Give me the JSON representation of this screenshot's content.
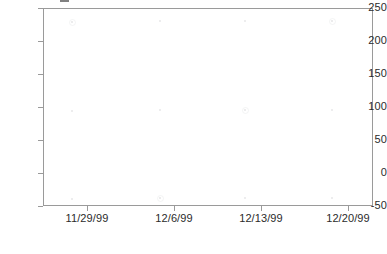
{
  "chart_data": {
    "type": "scatter",
    "title": "",
    "subtitle": "",
    "xlabel": "",
    "ylabel": "",
    "grid": false,
    "legend": "none",
    "ylim": [
      -50,
      250
    ],
    "y_ticks": [
      {
        "value": 250,
        "label": "250"
      },
      {
        "value": 200,
        "label": "200"
      },
      {
        "value": 150,
        "label": "150"
      },
      {
        "value": 100,
        "label": "100"
      },
      {
        "value": 50,
        "label": "50"
      },
      {
        "value": 0,
        "label": "0"
      },
      {
        "value": -50,
        "label": "-50"
      }
    ],
    "x_ticks": [
      {
        "label": "11/29/99",
        "px": 87
      },
      {
        "label": "12/6/99",
        "px": 174
      },
      {
        "label": "12/13/99",
        "px": 261
      },
      {
        "label": "12/20/99",
        "px": 348
      }
    ],
    "x_categories": [
      "11/29/99",
      "12/6/99",
      "12/13/99",
      "12/20/99"
    ],
    "series": [
      {
        "name": "series-1",
        "x": [
          "11/29/99",
          "12/6/99",
          "12/13/99",
          "12/20/99"
        ],
        "values": [
          230,
          230,
          230,
          230
        ]
      },
      {
        "name": "series-2",
        "x": [
          "11/29/99",
          "12/6/99",
          "12/13/99",
          "12/20/99"
        ],
        "values": [
          90,
          90,
          90,
          90
        ]
      },
      {
        "name": "series-3",
        "x": [
          "11/29/99",
          "12/6/99",
          "12/13/99",
          "12/20/99"
        ],
        "values": [
          -38,
          -38,
          -38,
          -38
        ]
      }
    ],
    "marker_points": [
      {
        "px": 72,
        "py": 22
      },
      {
        "px": 160,
        "py": 21
      },
      {
        "px": 245,
        "py": 21
      },
      {
        "px": 332,
        "py": 21
      },
      {
        "px": 72,
        "py": 111
      },
      {
        "px": 160,
        "py": 110
      },
      {
        "px": 245,
        "py": 110
      },
      {
        "px": 332,
        "py": 110
      },
      {
        "px": 72,
        "py": 199
      },
      {
        "px": 160,
        "py": 198
      },
      {
        "px": 245,
        "py": 198
      },
      {
        "px": 332,
        "py": 198
      }
    ],
    "colors": {
      "background": "#ffffff",
      "frame": "#9a9a9a",
      "tick": "#9a9a9a",
      "text": "#2b2b2b",
      "marker": "#6d737d"
    }
  }
}
